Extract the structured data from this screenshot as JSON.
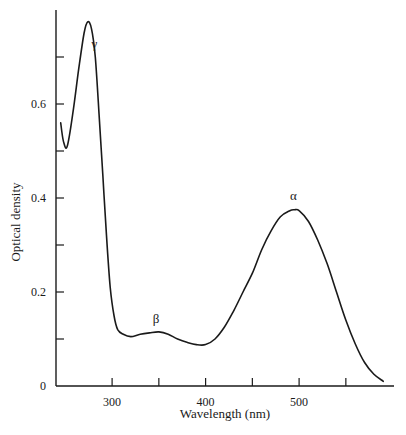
{
  "chart_data": {
    "type": "line",
    "title": "",
    "xlabel": "Wavelength (nm)",
    "ylabel": "Optical density",
    "xlim": [
      240,
      595
    ],
    "ylim": [
      0,
      0.8
    ],
    "grid": false,
    "legend": null,
    "x_ticks": [
      {
        "value": 300,
        "label": "300"
      },
      {
        "value": 350,
        "label": ""
      },
      {
        "value": 400,
        "label": "400"
      },
      {
        "value": 450,
        "label": ""
      },
      {
        "value": 500,
        "label": "500"
      },
      {
        "value": 550,
        "label": ""
      }
    ],
    "y_ticks": [
      {
        "value": 0,
        "label": "0"
      },
      {
        "value": 0.1,
        "label": ""
      },
      {
        "value": 0.2,
        "label": "0.2"
      },
      {
        "value": 0.3,
        "label": ""
      },
      {
        "value": 0.4,
        "label": "0.4"
      },
      {
        "value": 0.5,
        "label": ""
      },
      {
        "value": 0.6,
        "label": "0.6"
      },
      {
        "value": 0.7,
        "label": ""
      }
    ],
    "series": [
      {
        "name": "absorption spectrum",
        "x": [
          245,
          248,
          252,
          258,
          264,
          270,
          274,
          278,
          282,
          286,
          290,
          294,
          298,
          302,
          306,
          312,
          320,
          330,
          340,
          350,
          360,
          370,
          380,
          390,
          400,
          410,
          420,
          430,
          440,
          450,
          460,
          470,
          480,
          490,
          495,
          500,
          510,
          520,
          530,
          540,
          550,
          560,
          570,
          580,
          590
        ],
        "y": [
          0.56,
          0.52,
          0.51,
          0.58,
          0.67,
          0.75,
          0.775,
          0.76,
          0.7,
          0.58,
          0.45,
          0.32,
          0.21,
          0.15,
          0.12,
          0.11,
          0.105,
          0.11,
          0.113,
          0.115,
          0.11,
          0.1,
          0.093,
          0.088,
          0.088,
          0.1,
          0.125,
          0.16,
          0.2,
          0.24,
          0.29,
          0.33,
          0.36,
          0.373,
          0.375,
          0.373,
          0.35,
          0.31,
          0.26,
          0.2,
          0.14,
          0.09,
          0.05,
          0.025,
          0.01
        ]
      }
    ],
    "annotations": [
      {
        "text": "γ",
        "x": 281,
        "y": 0.72
      },
      {
        "text": "β",
        "x": 347,
        "y": 0.135
      },
      {
        "text": "α",
        "x": 494,
        "y": 0.395
      }
    ]
  }
}
